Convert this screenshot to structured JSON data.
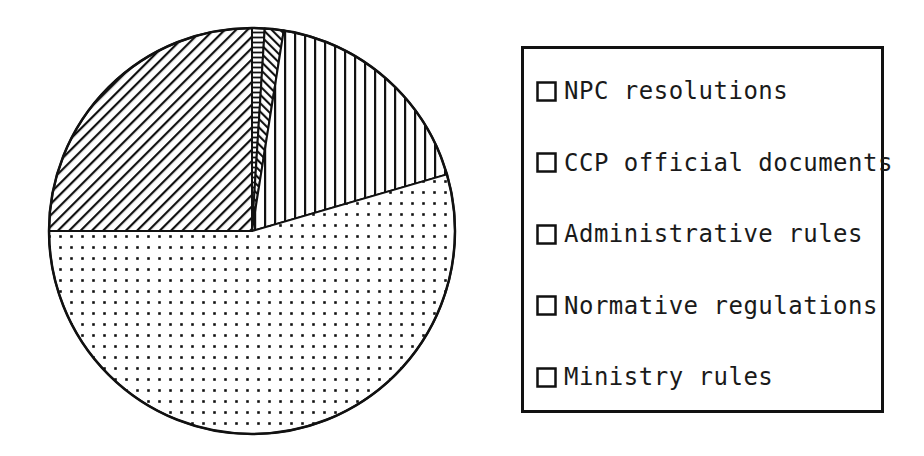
{
  "chart_data": {
    "type": "pie",
    "title": "",
    "unit": "percent (estimated from slice angles; no numeric labels shown)",
    "start_angle": "12-o'clock",
    "direction": "clockwise",
    "legend_position": "right",
    "series": [
      {
        "label": "NPC resolutions",
        "value": 1,
        "pattern": "horizontal-lines"
      },
      {
        "label": "CCP official documents",
        "value": 1.5,
        "pattern": "backslash-hatch"
      },
      {
        "label": "Administrative rules",
        "value": 18,
        "pattern": "vertical-lines"
      },
      {
        "label": "Normative regulations",
        "value": 54.5,
        "pattern": "dots"
      },
      {
        "label": "Ministry rules",
        "value": 25,
        "pattern": "slash-hatch"
      }
    ],
    "layout": {
      "cx": 252,
      "cy": 231,
      "r": 203
    }
  },
  "colors": {
    "ink": "#111111",
    "background": "#ffffff"
  }
}
